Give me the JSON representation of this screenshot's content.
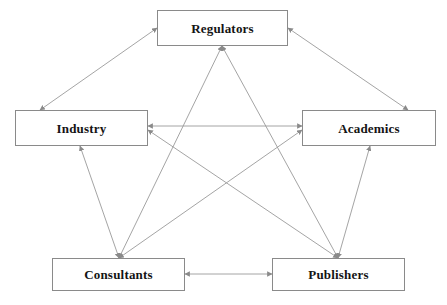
{
  "diagram": {
    "type": "node-link-diagram",
    "title": "",
    "background_color": "#ffffff",
    "canvas": {
      "width": 447,
      "height": 305
    },
    "node_style": {
      "fill": "#ffffff",
      "border_color": "#8a8a8a",
      "border_width": 1,
      "text_color": "#141414",
      "font_weight": "bold"
    },
    "edge_style": {
      "line_color": "#9a9a9a",
      "line_width": 0.9,
      "arrowhead_color": "#8a8a8a",
      "direction": "bidirectional"
    },
    "nodes": [
      {
        "id": "regulators",
        "label": "Regulators",
        "x": 157,
        "y": 10,
        "width": 131,
        "height": 36
      },
      {
        "id": "industry",
        "label": "Industry",
        "x": 15,
        "y": 110,
        "width": 133,
        "height": 36
      },
      {
        "id": "academics",
        "label": "Academics",
        "x": 302,
        "y": 110,
        "width": 134,
        "height": 36
      },
      {
        "id": "consultants",
        "label": "Consultants",
        "x": 52,
        "y": 258,
        "width": 133,
        "height": 33
      },
      {
        "id": "publishers",
        "label": "Publishers",
        "x": 272,
        "y": 258,
        "width": 133,
        "height": 33
      }
    ],
    "edges": [
      {
        "id": "edge-industry-regulators",
        "from": "industry",
        "to": "regulators",
        "arrows": "both",
        "x1": 40,
        "y1": 110,
        "x2": 157,
        "y2": 28
      },
      {
        "id": "edge-regulators-academics",
        "from": "regulators",
        "to": "academics",
        "arrows": "both",
        "x1": 288,
        "y1": 28,
        "x2": 408,
        "y2": 110
      },
      {
        "id": "edge-industry-academics",
        "from": "industry",
        "to": "academics",
        "arrows": "both",
        "x1": 148,
        "y1": 126,
        "x2": 302,
        "y2": 126
      },
      {
        "id": "edge-industry-consultants",
        "from": "industry",
        "to": "consultants",
        "arrows": "both",
        "x1": 80,
        "y1": 146,
        "x2": 119,
        "y2": 258
      },
      {
        "id": "edge-academics-publishers",
        "from": "academics",
        "to": "publishers",
        "arrows": "both",
        "x1": 370,
        "y1": 146,
        "x2": 338,
        "y2": 258
      },
      {
        "id": "edge-consultants-publishers",
        "from": "consultants",
        "to": "publishers",
        "arrows": "both",
        "x1": 185,
        "y1": 274,
        "x2": 272,
        "y2": 274
      },
      {
        "id": "edge-consultants-regulators",
        "from": "consultants",
        "to": "regulators",
        "arrows": "both",
        "x1": 119,
        "y1": 258,
        "x2": 222,
        "y2": 46
      },
      {
        "id": "edge-publishers-regulators",
        "from": "publishers",
        "to": "regulators",
        "arrows": "both",
        "x1": 338,
        "y1": 258,
        "x2": 222,
        "y2": 46
      },
      {
        "id": "edge-consultants-academics",
        "from": "consultants",
        "to": "academics",
        "arrows": "both",
        "x1": 119,
        "y1": 258,
        "x2": 302,
        "y2": 130
      },
      {
        "id": "edge-publishers-industry",
        "from": "publishers",
        "to": "industry",
        "arrows": "both",
        "x1": 338,
        "y1": 258,
        "x2": 148,
        "y2": 130
      }
    ]
  }
}
